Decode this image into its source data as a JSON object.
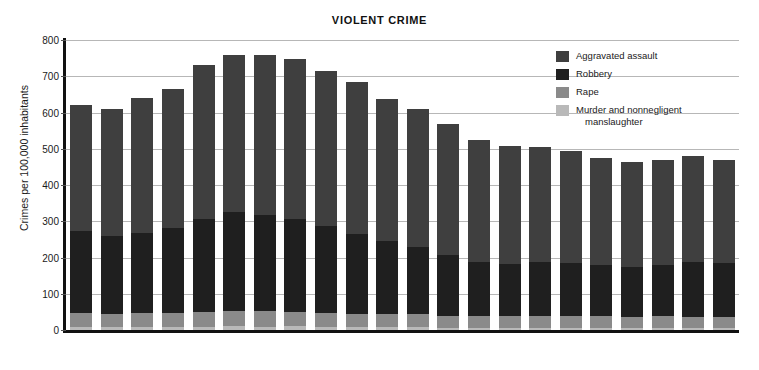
{
  "chart_data": {
    "type": "bar",
    "subtype": "stacked-bar",
    "title": "VIOLENT CRIME",
    "xlabel": "",
    "ylabel": "Crimes per 100,000 inhabitants",
    "ylim": [
      0,
      800
    ],
    "ytick_step": 100,
    "yticks": [
      "0",
      "100",
      "200",
      "300",
      "400",
      "500",
      "600",
      "700",
      "800"
    ],
    "grid": true,
    "legend_position": "top-right-inside",
    "categories": [
      "1986",
      "1987",
      "1988",
      "1989",
      "1990",
      "1991",
      "1992",
      "1993",
      "1994",
      "1995",
      "1996",
      "1997",
      "1998",
      "1999",
      "2000",
      "2001",
      "2002",
      "2003",
      "2004",
      "2005",
      "2006",
      "2007"
    ],
    "series": [
      {
        "name": "Murder and nonnegligent manslaughter",
        "color": "#b9b9b9",
        "values": [
          9,
          8,
          8,
          9,
          9,
          10,
          9,
          10,
          9,
          8,
          7,
          7,
          6,
          6,
          6,
          6,
          6,
          6,
          5,
          6,
          6,
          6
        ]
      },
      {
        "name": "Rape",
        "color": "#8a8a8a",
        "values": [
          38,
          37,
          38,
          38,
          41,
          42,
          43,
          41,
          39,
          37,
          36,
          36,
          34,
          33,
          32,
          32,
          33,
          32,
          32,
          32,
          31,
          30
        ]
      },
      {
        "name": "Robbery",
        "color": "#1f1f1f",
        "values": [
          226,
          213,
          221,
          234,
          257,
          273,
          264,
          256,
          238,
          221,
          202,
          186,
          166,
          150,
          145,
          149,
          146,
          142,
          137,
          141,
          150,
          148
        ]
      },
      {
        "name": "Aggravated assault",
        "color": "#3f3f3f",
        "values": [
          347,
          352,
          372,
          383,
          424,
          433,
          442,
          440,
          428,
          418,
          391,
          382,
          361,
          334,
          324,
          319,
          310,
          295,
          289,
          291,
          292,
          284
        ]
      }
    ],
    "totals": [
      620,
      610,
      639,
      664,
      731,
      758,
      758,
      747,
      714,
      684,
      636,
      611,
      567,
      523,
      507,
      506,
      495,
      475,
      463,
      470,
      479,
      468
    ],
    "legend_entries": [
      {
        "label": "Aggravated assault",
        "color": "#3f3f3f"
      },
      {
        "label": "Robbery",
        "color": "#1f1f1f"
      },
      {
        "label": "Rape",
        "color": "#8a8a8a"
      },
      {
        "label": "Murder and nonnegligent",
        "label_line2": "manslaughter",
        "color": "#b9b9b9"
      }
    ]
  }
}
